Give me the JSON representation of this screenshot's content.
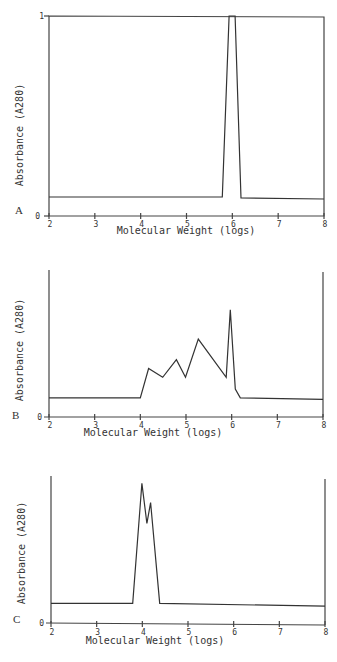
{
  "chart_data": [
    {
      "type": "line",
      "panel_label": "A",
      "xlabel": "Molecular Weight (logs)",
      "ylabel": "Absorbance (A280)",
      "xlim": [
        2,
        8
      ],
      "ylim": [
        0,
        1
      ],
      "x_ticks": [
        "2",
        "3",
        "4",
        "5",
        "6",
        "7",
        "8"
      ],
      "y_ticks": [
        "0",
        "1"
      ],
      "x": [
        2.0,
        5.78,
        5.93,
        6.06,
        6.19,
        8.0
      ],
      "y": [
        0.095,
        0.095,
        1.0,
        1.0,
        0.09,
        0.085
      ],
      "box": "top and right axes drawn"
    },
    {
      "type": "line",
      "panel_label": "B",
      "xlabel": "Molecular Weight (logs)",
      "ylabel": "Absorbance (A280)",
      "xlim": [
        2,
        8
      ],
      "ylim": [
        0,
        1
      ],
      "x_ticks": [
        "2",
        "3",
        "4",
        "5",
        "6",
        "7",
        "8"
      ],
      "y_ticks": [
        "0"
      ],
      "x": [
        2.0,
        4.0,
        4.18,
        4.49,
        4.79,
        4.99,
        5.27,
        5.88,
        5.97,
        6.08,
        6.19,
        8.0
      ],
      "y": [
        0.13,
        0.13,
        0.33,
        0.27,
        0.39,
        0.27,
        0.53,
        0.27,
        0.73,
        0.19,
        0.13,
        0.12
      ]
    },
    {
      "type": "line",
      "panel_label": "C",
      "xlabel": "Molecular Weight (logs)",
      "ylabel": "Absorbance (A280)",
      "xlim": [
        2,
        8
      ],
      "ylim": [
        0,
        1
      ],
      "x_ticks": [
        "2",
        "3",
        "4",
        "5",
        "6",
        "7",
        "8"
      ],
      "y_ticks": [
        "0"
      ],
      "x": [
        2.0,
        3.79,
        3.99,
        4.1,
        4.18,
        4.38,
        8.0
      ],
      "y": [
        0.14,
        0.14,
        0.95,
        0.68,
        0.82,
        0.14,
        0.12
      ]
    }
  ],
  "panels": {
    "A": {
      "label": "A",
      "xlabel": "Molecular Weight (logs)",
      "ylabel": "Absorbance (A280)",
      "ytick_top": "1",
      "ytick_bottom": "0"
    },
    "B": {
      "label": "B",
      "xlabel": "Molecular Weight (logs)",
      "ylabel": "Absorbance (A280)",
      "ytick_bottom": "0"
    },
    "C": {
      "label": "C",
      "xlabel": "Molecular Weight (logs)",
      "ylabel": "Absorbance (A280)",
      "ytick_bottom": "0"
    }
  },
  "x_ticks": [
    "2",
    "3",
    "4",
    "5",
    "6",
    "7",
    "8"
  ]
}
